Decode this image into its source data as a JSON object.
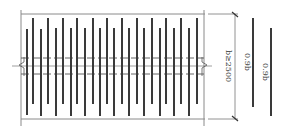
{
  "diagram": {
    "title": "",
    "labels": {
      "width_dim": "b≥2500",
      "bar_len_1": "0.9b",
      "bar_len_2": "0.9b"
    },
    "colors": {
      "bar": "#3a3a3a",
      "frame": "#8a8a8a",
      "dash": "#555555",
      "background": "#ffffff"
    },
    "bars": [
      {
        "x": 27,
        "y1": 29,
        "y2": 115
      },
      {
        "x": 33,
        "y1": 18,
        "y2": 104
      },
      {
        "x": 41,
        "y1": 29,
        "y2": 116
      },
      {
        "x": 48,
        "y1": 18,
        "y2": 104
      },
      {
        "x": 56,
        "y1": 28,
        "y2": 116
      },
      {
        "x": 63,
        "y1": 18,
        "y2": 104
      },
      {
        "x": 71,
        "y1": 28,
        "y2": 116
      },
      {
        "x": 77,
        "y1": 18,
        "y2": 104
      },
      {
        "x": 85,
        "y1": 28,
        "y2": 116
      },
      {
        "x": 93,
        "y1": 18,
        "y2": 104
      },
      {
        "x": 100,
        "y1": 28,
        "y2": 116
      },
      {
        "x": 107,
        "y1": 18,
        "y2": 104
      },
      {
        "x": 114,
        "y1": 28,
        "y2": 116
      },
      {
        "x": 122,
        "y1": 18,
        "y2": 104
      },
      {
        "x": 129,
        "y1": 28,
        "y2": 116
      },
      {
        "x": 137,
        "y1": 18,
        "y2": 104
      },
      {
        "x": 144,
        "y1": 28,
        "y2": 116
      },
      {
        "x": 152,
        "y1": 18,
        "y2": 104
      },
      {
        "x": 160,
        "y1": 28,
        "y2": 116
      },
      {
        "x": 166,
        "y1": 18,
        "y2": 104
      },
      {
        "x": 174,
        "y1": 28,
        "y2": 116
      },
      {
        "x": 181,
        "y1": 18,
        "y2": 104
      },
      {
        "x": 189,
        "y1": 28,
        "y2": 116
      },
      {
        "x": 197,
        "y1": 18,
        "y2": 104
      }
    ],
    "side_bars": [
      {
        "x": 253,
        "y1": 18,
        "y2": 107
      },
      {
        "x": 271,
        "y1": 28,
        "y2": 116
      }
    ]
  }
}
